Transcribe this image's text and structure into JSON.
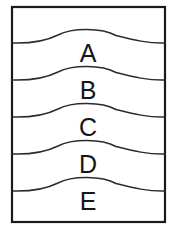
{
  "diagram": {
    "type": "stratigraphic-layer-diagram",
    "frame": {
      "x": 12,
      "y": 7,
      "width": 153,
      "height": 215,
      "stroke_color": "#1a1a1a",
      "fill_color": "#ffffff",
      "stroke_width": 2.2
    },
    "curve_style": {
      "stroke_color": "#2b2b2b",
      "stroke_width": 1.5,
      "crest_x": 88,
      "crest_rise": 17
    },
    "layers": [
      {
        "label": "A",
        "curve_edge_y": 43,
        "crest_y": 26,
        "label_x": 88,
        "label_y": 62
      },
      {
        "label": "B",
        "curve_edge_y": 80,
        "crest_y": 63,
        "label_x": 88,
        "label_y": 99
      },
      {
        "label": "C",
        "curve_edge_y": 117,
        "crest_y": 100,
        "label_x": 88,
        "label_y": 136
      },
      {
        "label": "D",
        "curve_edge_y": 154,
        "crest_y": 137,
        "label_x": 88,
        "label_y": 173
      },
      {
        "label": "E",
        "curve_edge_y": 191,
        "crest_y": 174,
        "label_x": 88,
        "label_y": 210
      }
    ]
  }
}
